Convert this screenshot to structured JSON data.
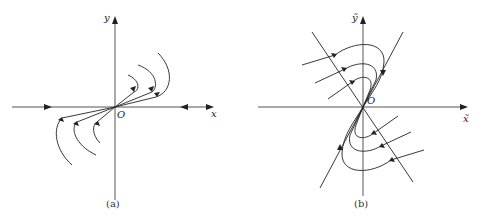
{
  "figure": {
    "panels": [
      {
        "id": "a",
        "caption": "(a)",
        "x_axis_label": "x",
        "y_axis_label": "y",
        "origin_label": "O",
        "description": "Phase portrait with trajectories approaching origin tangentially to a slightly inclined direction; arrows on x-axis point toward origin"
      },
      {
        "id": "b",
        "caption": "(b)",
        "x_axis_label": "x̃",
        "y_axis_label": "ỹ",
        "origin_label": "O",
        "description": "Phase portrait with two oblique lines through origin; trajectories curve and approach origin along the steeper line"
      }
    ]
  }
}
